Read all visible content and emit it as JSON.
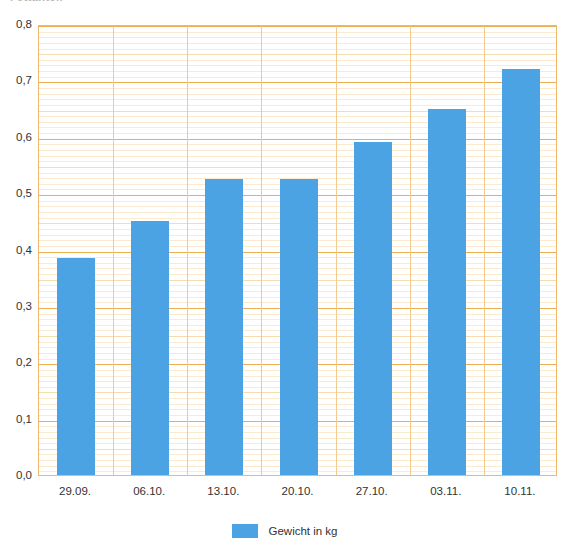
{
  "chart_data": {
    "type": "bar",
    "title": "Fettanteil",
    "categories": [
      "29.09.",
      "06.10.",
      "13.10.",
      "20.10.",
      "27.10.",
      "03.11.",
      "10.11."
    ],
    "values": [
      0.385,
      0.45,
      0.525,
      0.525,
      0.59,
      0.65,
      0.72
    ],
    "series": [
      {
        "name": "Gewicht in kg",
        "values": [
          0.385,
          0.45,
          0.525,
          0.525,
          0.59,
          0.65,
          0.72
        ],
        "color": "#4ba3e3"
      }
    ],
    "xlabel": "",
    "ylabel": "",
    "ylim": [
      0.0,
      0.8
    ],
    "y_tick_labels": [
      "0,0",
      "0,1",
      "0,2",
      "0,3",
      "0,4",
      "0,5",
      "0,6",
      "0,7",
      "0,8"
    ],
    "y_tick_values": [
      0.0,
      0.1,
      0.2,
      0.3,
      0.4,
      0.5,
      0.6,
      0.7,
      0.8
    ],
    "y_minor_step": 0.01,
    "grid": true,
    "grid_color_major": "#efad52",
    "grid_color_minor": "#fbeacd",
    "legend_position": "bottom",
    "legend_entries": [
      "Gewicht in kg"
    ],
    "decimal_separator": ","
  },
  "title": {
    "text": "Fettanteil",
    "clipped": true
  },
  "legend": {
    "label": "Gewicht in kg"
  }
}
